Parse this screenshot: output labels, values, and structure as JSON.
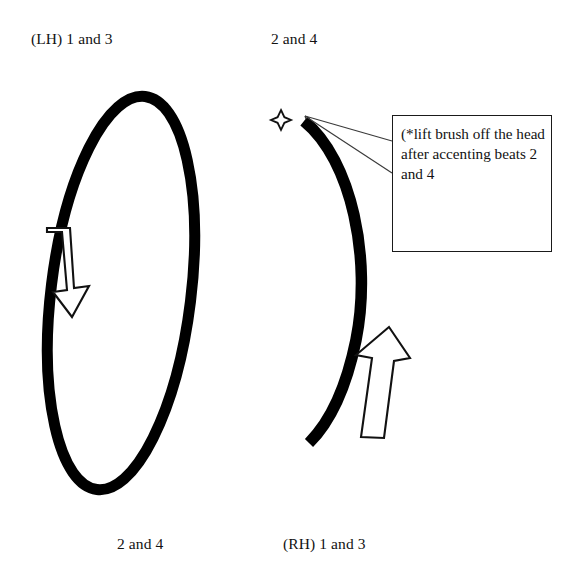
{
  "diagram": {
    "title_text_color": "#121212",
    "stroke_color": "#000000",
    "background_color": "#ffffff",
    "labels": {
      "top_left": "(LH) 1 and 3",
      "top_right": "2 and 4",
      "bottom_left": "2 and 4",
      "bottom_right": "(RH) 1 and 3"
    },
    "callout": {
      "text": "(*lift brush off the head after accenting beats 2 and 4"
    },
    "shapes": {
      "left_pattern_name": "tilted-ellipse-loop",
      "left_arrow_direction": "down",
      "right_pattern_name": "open-arc-crescent",
      "right_arrow_direction": "up",
      "marker_name": "four-point-star"
    }
  }
}
